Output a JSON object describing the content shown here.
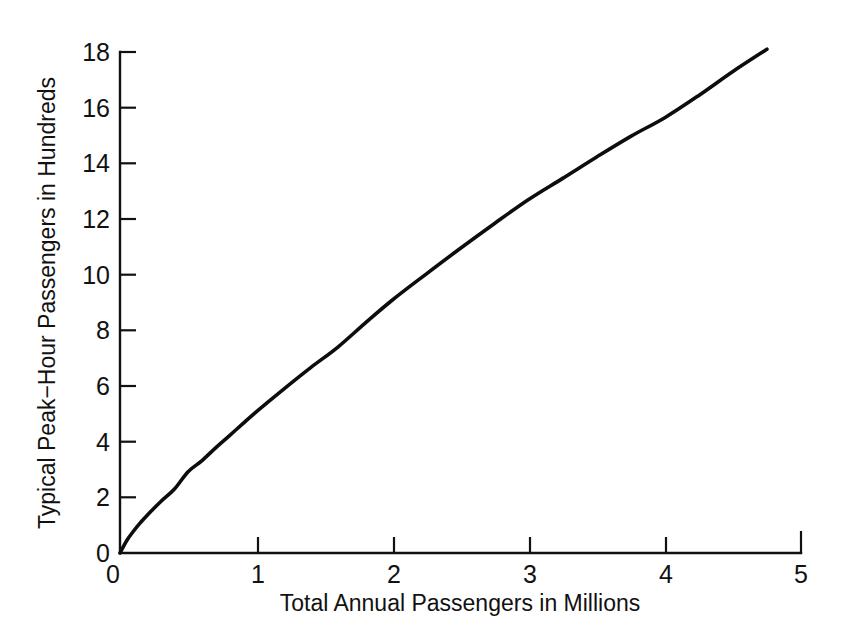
{
  "chart_data": {
    "type": "line",
    "title": "",
    "subtitle": "",
    "xlabel": "Total Annual Passengers in Millions",
    "ylabel": "Typical Peak−Hour Passengers in Hundreds",
    "xlim": [
      0,
      5
    ],
    "ylim": [
      0,
      18
    ],
    "xticks": [
      0,
      1,
      2,
      3,
      4,
      5
    ],
    "xtick_labels": [
      "0",
      "1",
      "2",
      "3",
      "4",
      "5"
    ],
    "yticks": [
      0,
      2,
      4,
      6,
      8,
      10,
      12,
      14,
      16,
      18
    ],
    "ytick_labels": [
      "0",
      "2",
      "4",
      "6",
      "8",
      "10",
      "12",
      "14",
      "16",
      "18"
    ],
    "grid": false,
    "legend": null,
    "tick_direction": "in",
    "series": [
      {
        "name": "Typical peak-hour passengers",
        "color": "#0d0d0d",
        "x": [
          0.0,
          0.05,
          0.1,
          0.15,
          0.2,
          0.3,
          0.4,
          0.5,
          0.6,
          0.7,
          0.8,
          0.9,
          1.0,
          1.2,
          1.4,
          1.6,
          1.8,
          2.0,
          2.25,
          2.5,
          2.75,
          3.0,
          3.25,
          3.5,
          3.75,
          4.0,
          4.25,
          4.5,
          4.75
        ],
        "y": [
          0.0,
          0.45,
          0.79,
          1.09,
          1.36,
          1.85,
          2.3,
          2.92,
          3.31,
          3.77,
          4.2,
          4.64,
          5.07,
          5.88,
          6.66,
          7.4,
          8.26,
          9.09,
          10.03,
          10.95,
          11.84,
          12.7,
          13.46,
          14.23,
          14.97,
          15.64,
          16.44,
          17.3,
          18.1
        ]
      }
    ],
    "annotations": []
  },
  "axes": {
    "x_axis_name": "x-axis",
    "y_axis_name": "y-axis"
  },
  "colors": {
    "background": "#ffffff",
    "ink": "#111111",
    "curve": "#0d0d0d"
  }
}
